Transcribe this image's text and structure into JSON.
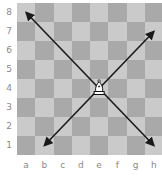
{
  "board": {
    "files": [
      "a",
      "b",
      "c",
      "d",
      "e",
      "f",
      "g",
      "h"
    ],
    "ranks": [
      "8",
      "7",
      "6",
      "5",
      "4",
      "3",
      "2",
      "1"
    ],
    "light_color": "#cacaca",
    "dark_color": "#a9a9a9",
    "label_color": "#8a8a8a"
  },
  "pieces": [
    {
      "type": "bishop",
      "color": "white",
      "square": "e4"
    }
  ],
  "arrows": [
    {
      "from": "e4",
      "to": "a8",
      "color": "#1a1a1a"
    },
    {
      "from": "e4",
      "to": "h7",
      "color": "#1a1a1a"
    },
    {
      "from": "e4",
      "to": "b1",
      "color": "#1a1a1a"
    },
    {
      "from": "e4",
      "to": "h1",
      "color": "#1a1a1a"
    }
  ]
}
